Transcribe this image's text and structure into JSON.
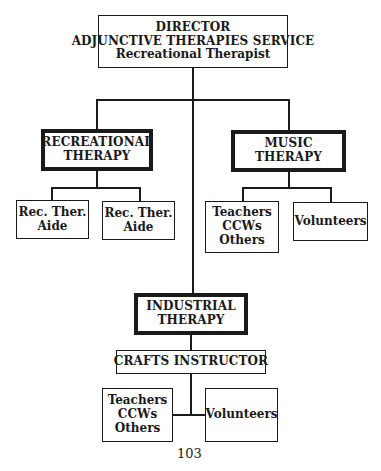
{
  "director": {
    "line1": "DIRECTOR",
    "line2": "ADJUNCTIVE THERAPIES SERVICE",
    "line3": "Recreational Therapist"
  },
  "recreational": {
    "line1": "RECREATIONAL",
    "line2": "THERAPY"
  },
  "music": {
    "line1": "MUSIC",
    "line2": "THERAPY"
  },
  "rec_aide_1": {
    "line1": "Rec. Ther.",
    "line2": "Aide"
  },
  "rec_aide_2": {
    "line1": "Rec. Ther.",
    "line2": "Aide"
  },
  "music_staff": {
    "line1": "Teachers",
    "line2": "CCWs",
    "line3": "Others"
  },
  "music_volunteers": {
    "line1": "Volunteers"
  },
  "industrial": {
    "line1": "INDUSTRIAL",
    "line2": "THERAPY"
  },
  "crafts": {
    "line1": "CRAFTS INSTRUCTOR"
  },
  "industrial_staff": {
    "line1": "Teachers",
    "line2": "CCWs",
    "line3": "Others"
  },
  "industrial_volunteers": {
    "line1": "Volunteers"
  },
  "page_number": "103"
}
